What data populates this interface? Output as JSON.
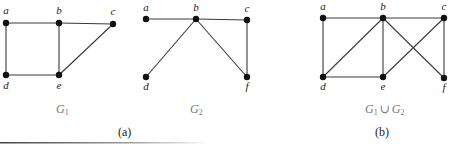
{
  "figure": {
    "panels": [
      {
        "id": "G1",
        "label_main": "G",
        "label_sub": "1",
        "vertices": [
          {
            "name": "a",
            "x": 6,
            "y": 23,
            "lx": 6,
            "ly": 14
          },
          {
            "name": "b",
            "x": 59,
            "y": 23,
            "lx": 59,
            "ly": 14
          },
          {
            "name": "c",
            "x": 113,
            "y": 24,
            "lx": 113,
            "ly": 15
          },
          {
            "name": "d",
            "x": 6,
            "y": 75,
            "lx": 6,
            "ly": 89
          },
          {
            "name": "e",
            "x": 59,
            "y": 75,
            "lx": 59,
            "ly": 89
          }
        ],
        "edges": [
          [
            "a",
            "b"
          ],
          [
            "b",
            "c"
          ],
          [
            "a",
            "d"
          ],
          [
            "b",
            "e"
          ],
          [
            "d",
            "e"
          ],
          [
            "e",
            "c"
          ]
        ]
      },
      {
        "id": "G2",
        "label_main": "G",
        "label_sub": "2",
        "vertices": [
          {
            "name": "a",
            "x": 146,
            "y": 19,
            "lx": 146,
            "ly": 11
          },
          {
            "name": "b",
            "x": 196,
            "y": 19,
            "lx": 196,
            "ly": 11
          },
          {
            "name": "c",
            "x": 247,
            "y": 20,
            "lx": 247,
            "ly": 12
          },
          {
            "name": "d",
            "x": 146,
            "y": 77,
            "lx": 146,
            "ly": 90
          },
          {
            "name": "f",
            "x": 247,
            "y": 77,
            "lx": 247,
            "ly": 90
          }
        ],
        "edges": [
          [
            "a",
            "b"
          ],
          [
            "b",
            "c"
          ],
          [
            "b",
            "d"
          ],
          [
            "b",
            "f"
          ],
          [
            "c",
            "f"
          ]
        ]
      },
      {
        "id": "G1uG2",
        "label_main": "G",
        "label_sub": "1",
        "label_union": "∪",
        "label_main2": "G",
        "label_sub2": "2",
        "vertices": [
          {
            "name": "a",
            "x": 323,
            "y": 18,
            "lx": 323,
            "ly": 10
          },
          {
            "name": "b",
            "x": 383,
            "y": 18,
            "lx": 383,
            "ly": 10
          },
          {
            "name": "c",
            "x": 444,
            "y": 18,
            "lx": 444,
            "ly": 10
          },
          {
            "name": "d",
            "x": 323,
            "y": 77,
            "lx": 323,
            "ly": 90
          },
          {
            "name": "e",
            "x": 383,
            "y": 77,
            "lx": 383,
            "ly": 90
          },
          {
            "name": "f",
            "x": 444,
            "y": 78,
            "lx": 444,
            "ly": 91
          }
        ],
        "edges": [
          [
            "a",
            "b"
          ],
          [
            "b",
            "c"
          ],
          [
            "a",
            "d"
          ],
          [
            "b",
            "d"
          ],
          [
            "b",
            "e"
          ],
          [
            "b",
            "f"
          ],
          [
            "d",
            "e"
          ],
          [
            "e",
            "c"
          ],
          [
            "c",
            "f"
          ]
        ]
      }
    ],
    "captions": {
      "a": "(a)",
      "b": "(b)"
    }
  }
}
